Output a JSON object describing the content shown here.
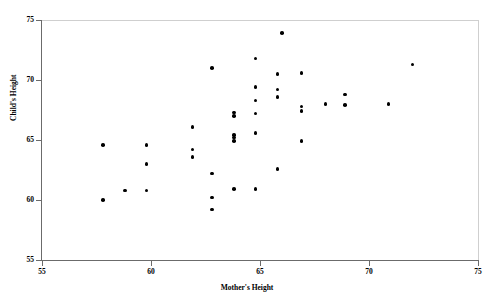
{
  "chart_data": {
    "type": "scatter",
    "title": "",
    "xlabel": "Mother's Height",
    "ylabel": "Child's Height",
    "xlim": [
      55,
      75
    ],
    "ylim": [
      55,
      75
    ],
    "xticks": [
      55,
      60,
      65,
      70,
      75
    ],
    "yticks": [
      55,
      60,
      65,
      70,
      75
    ],
    "xtick_labels": [
      "55",
      "60",
      "65",
      "70",
      "75"
    ],
    "ytick_labels": [
      "55",
      "60",
      "65",
      "70",
      "75"
    ],
    "grid": false,
    "legend": null,
    "marker": "filled-circle",
    "marker_color": "#000000",
    "points": [
      {
        "x": 57.8,
        "y": 64.6
      },
      {
        "x": 57.8,
        "y": 60.0
      },
      {
        "x": 58.8,
        "y": 60.8
      },
      {
        "x": 59.8,
        "y": 64.6
      },
      {
        "x": 59.8,
        "y": 63.0
      },
      {
        "x": 59.8,
        "y": 60.8
      },
      {
        "x": 61.9,
        "y": 66.1
      },
      {
        "x": 61.9,
        "y": 64.2
      },
      {
        "x": 61.9,
        "y": 63.6
      },
      {
        "x": 62.8,
        "y": 71.0
      },
      {
        "x": 62.8,
        "y": 62.2
      },
      {
        "x": 62.8,
        "y": 60.2
      },
      {
        "x": 62.8,
        "y": 59.2
      },
      {
        "x": 63.8,
        "y": 67.3
      },
      {
        "x": 63.8,
        "y": 67.0
      },
      {
        "x": 63.8,
        "y": 65.4
      },
      {
        "x": 63.8,
        "y": 65.2
      },
      {
        "x": 63.8,
        "y": 64.9
      },
      {
        "x": 63.8,
        "y": 60.9
      },
      {
        "x": 64.8,
        "y": 71.8
      },
      {
        "x": 64.8,
        "y": 69.4
      },
      {
        "x": 64.8,
        "y": 68.3
      },
      {
        "x": 64.8,
        "y": 67.2
      },
      {
        "x": 64.8,
        "y": 65.6
      },
      {
        "x": 64.8,
        "y": 60.9
      },
      {
        "x": 65.8,
        "y": 70.5
      },
      {
        "x": 65.8,
        "y": 69.2
      },
      {
        "x": 65.8,
        "y": 68.6
      },
      {
        "x": 65.8,
        "y": 62.6
      },
      {
        "x": 66.0,
        "y": 73.9
      },
      {
        "x": 66.9,
        "y": 70.6
      },
      {
        "x": 66.9,
        "y": 67.8
      },
      {
        "x": 66.9,
        "y": 67.4
      },
      {
        "x": 66.9,
        "y": 64.9
      },
      {
        "x": 68.0,
        "y": 68.0
      },
      {
        "x": 68.9,
        "y": 68.8
      },
      {
        "x": 68.9,
        "y": 67.9
      },
      {
        "x": 70.9,
        "y": 68.0
      },
      {
        "x": 72.0,
        "y": 71.3
      }
    ]
  }
}
